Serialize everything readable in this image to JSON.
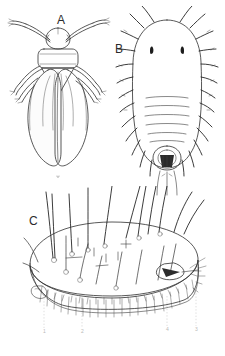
{
  "figure": {
    "kind": "scientific-line-drawing-plate",
    "background_color": "#ffffff",
    "ink_color": "#2f2f2f",
    "panels": [
      {
        "id": "A",
        "label": "A",
        "subject": "adult whitefly, dorsal view",
        "features": [
          "head",
          "antennae",
          "thorax",
          "forewings",
          "hindwings",
          "legs",
          "abdomen"
        ]
      },
      {
        "id": "B",
        "label": "B",
        "subject": "nymph / puparium, dorsal view",
        "features": [
          "marginal setae",
          "eye spots",
          "abdominal segmentation",
          "vasiform orifice",
          "caudal setae"
        ]
      },
      {
        "id": "C",
        "label": "C",
        "subject": "puparium, lateral view with wax fringe",
        "features": [
          "dorsal setae",
          "dorsal disc",
          "wax fringe",
          "marginal teeth",
          "vasiform orifice"
        ]
      }
    ],
    "leader_labels": [
      {
        "num": "1",
        "x": 44,
        "y": 333
      },
      {
        "num": "2",
        "x": 82,
        "y": 333
      },
      {
        "num": "4",
        "x": 167,
        "y": 331
      },
      {
        "num": "3",
        "x": 196,
        "y": 331
      }
    ]
  }
}
